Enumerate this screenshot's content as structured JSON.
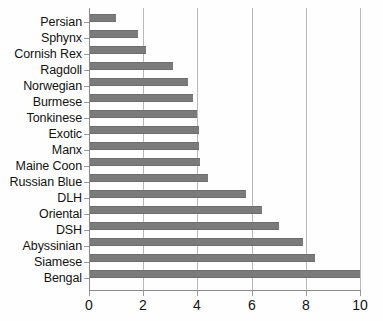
{
  "chart_data": {
    "type": "bar",
    "orientation": "horizontal",
    "title": "",
    "subtitle": "",
    "xlabel": "",
    "ylabel": "",
    "xlim": [
      0,
      10
    ],
    "ylim": null,
    "xticks": [
      "0",
      "2",
      "4",
      "6",
      "8",
      "10"
    ],
    "xtick_values": [
      0,
      2,
      4,
      6,
      8,
      10
    ],
    "grid": "vertical",
    "legend": "none",
    "legend_position": "none",
    "bar_color": "#7b7b7b",
    "axis_color": "#8c8c8c",
    "gridline_color": "#b9b9b9",
    "text_color": "#121212",
    "background": "#ffffff",
    "categories": [
      "Persian",
      "Sphynx",
      "Cornish Rex",
      "Ragdoll",
      "Norwegian",
      "Burmese",
      "Tonkinese",
      "Exotic",
      "Manx",
      "Maine Coon",
      "Russian Blue",
      "DLH",
      "Oriental",
      "DSH",
      "Abyssinian",
      "Siamese",
      "Bengal"
    ],
    "values": [
      1.0,
      1.8,
      2.1,
      3.1,
      3.65,
      3.85,
      4.0,
      4.05,
      4.05,
      4.1,
      4.4,
      5.8,
      6.4,
      7.0,
      7.9,
      8.35,
      10.0
    ],
    "series": [
      {
        "name": "",
        "values": [
          1.0,
          1.8,
          2.1,
          3.1,
          3.65,
          3.85,
          4.0,
          4.05,
          4.05,
          4.1,
          4.4,
          5.8,
          6.4,
          7.0,
          7.9,
          8.35,
          10.0
        ]
      }
    ]
  }
}
